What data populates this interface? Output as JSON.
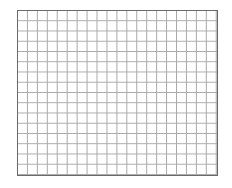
{
  "grid": {
    "columns": 20,
    "rows": 16,
    "line_color": "#a9a9a9",
    "border_color": "#6a6a6a",
    "background_color": "#ffffff"
  }
}
